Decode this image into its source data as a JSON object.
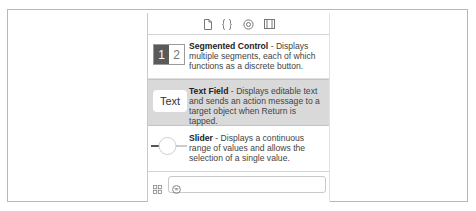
{
  "toolbar": {
    "icons": [
      "file-inspector-icon",
      "quick-help-icon",
      "object-library-icon",
      "media-library-icon"
    ]
  },
  "library": {
    "items": [
      {
        "name": "Segmented Control",
        "separator": " - ",
        "description": "Displays multiple segments, each of which functions as a discrete button.",
        "icon": "segmented-control-icon",
        "icon_labels": [
          "1",
          "2"
        ],
        "selected": false
      },
      {
        "name": "Text Field",
        "separator": " - ",
        "description": "Displays editable text and sends an action message to a target object when Return is tapped.",
        "icon": "text-field-icon",
        "icon_label": "Text",
        "selected": true
      },
      {
        "name": "Slider",
        "separator": " - ",
        "description": "Displays a continuous range of values and allows the selection of a single value.",
        "icon": "slider-icon",
        "selected": false
      }
    ]
  },
  "bottombar": {
    "view_toggle_icon": "grid-view-icon",
    "filter_icon": "filter-icon",
    "search_value": "",
    "search_placeholder": ""
  },
  "colors": {
    "selected_row": "#d9d9d9",
    "segment_dark": "#5a5a5a",
    "border": "#c8c8c8"
  }
}
